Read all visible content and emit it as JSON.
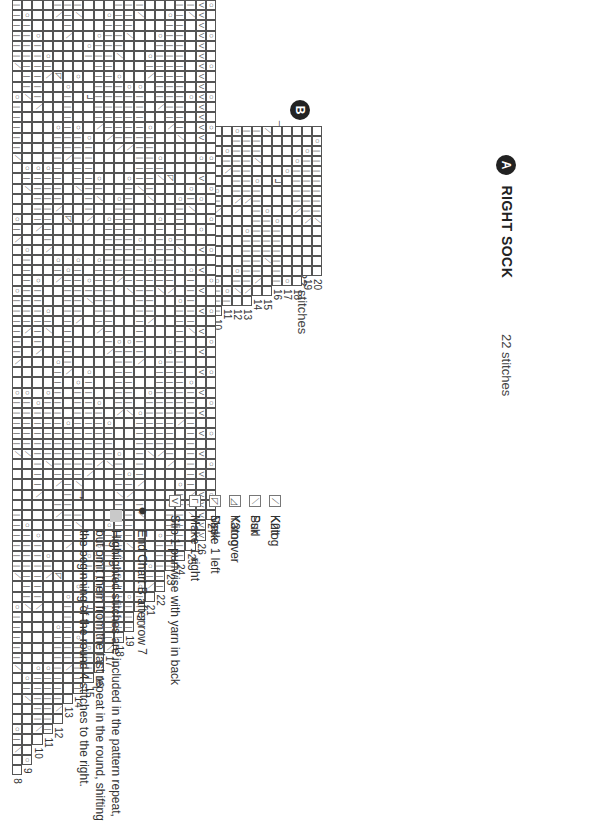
{
  "symbols": {
    "knit": "",
    "purl": "|",
    "yarnover": "○",
    "k2tog": "⟋",
    "ssk": "⟍",
    "k3tog": "◿",
    "sssk": "◸",
    "make1left": "⅃",
    "make1right": "Γ",
    "slip": "V"
  },
  "colors": {
    "grid_line": "#555555",
    "highlight": "#c9c9c9",
    "badge": "#222222"
  },
  "chart_a": {
    "badge": "A",
    "title": "RIGHT SOCK",
    "stitch_count": "22 stitches",
    "row_labels": [
      "1",
      "2"
    ],
    "rows": [
      "..---...---...---...-.",
      "..---...---...---...-."
    ]
  },
  "chart_b": {
    "badge": "B",
    "title": "RIGHT SOCK",
    "stitch_count": "22 stitches",
    "row_labels": [
      "1",
      "2",
      "3",
      "4",
      "5",
      "6",
      "7",
      "8",
      "9",
      "10",
      "11",
      "12",
      "13",
      "14",
      "15",
      "16",
      "17",
      "18",
      "19",
      "20"
    ],
    "end_marker_after_row": "7",
    "rows": [
      ">.....................",
      "......................",
      "..>...................",
      "..o-\\.................",
      "o------\\..............",
      "-------\\-o............",
      "---/.o----\\...........",
      "/.......o----\\........",
      ".........o----\\..o-...",
      "......o-\\......o------",
      "..o-\\...........o-----",
      "o------\\......o-/.....",
      "-------\\..o-----\\.....",
      "---/.o---------\\......",
      "/.......o----/........",
      ".....L...o--------\\...",
      "....o..........o-/...#",
      "...o----\\.......o---\\#",
      "..o------\\.......o--/#",
      ".o-------/........o-\\#"
    ]
  },
  "big_chart": {
    "row_labels": [
      "8",
      "9",
      "10",
      "11",
      "12",
      "13",
      "14",
      "15",
      "16",
      "17",
      "18",
      "19",
      "20",
      "21",
      "22",
      "23",
      "24",
      "25",
      "26",
      "27"
    ],
    "pattern_rows": [
      "------/..o-----/.....o-\\....o------\\..o-----/.....",
      ".o-------/......o-/.....o-------\\.....o-----/.....",
      "...o------\\.....o-----\\....o------\\....o--------\\",
      ".....o-\\........o-------\\.....o-/.....o------/...",
      "-\\.....>....o-------\\....o-\\.......o-----------\\.",
      "---\\....o------\\.....>....o---------\\....o--------",
      "-/.....o....o-----/......o-----\\.....o---------/..",
      "....o-...L...o-------\\.....o-/......o---------\\...",
      "...o--------\\....o-/.....o------\\......o-----\\....",
      ".o-----------\\.......o------------\\......o---/....",
      "-----/.o------\\....o-------\\.....o------\\...o---/",
      "---/....o-----\\..o----------/....o------/.....o-\\.",
      "-/......o---------/....o-----------\\....o------\\.",
      ".....o-\\....o------/.....o-----\\......o-----/.....",
      "...o------\\....o-/...o------/......o--------\\....",
      ".o----------\\....>.....o----\\.....o----------\\..",
      "-------------/.....o----/....o-----------\\.....o-",
      "-/.......o........o-/.....o-----/....o----------\\",
      "vvvvvvvvvvvvvv.o.v.o..o.v.v.v.v.v.v.v.v.v.v.v.v.v",
      "o..o..o..o..o..o..o..o..o..o..o..o..o..o..o..o..o"
    ]
  },
  "legend": {
    "items": [
      {
        "symbol": "knit",
        "label": "Knit"
      },
      {
        "symbol": "purl",
        "label": "Purl"
      },
      {
        "symbol": "yarnover",
        "label": "Yarnover"
      },
      {
        "symbol": "make1left",
        "label": "Make 1 left"
      },
      {
        "symbol": "make1right",
        "label": "Make 1 right"
      },
      {
        "symbol": "slip",
        "label": "Slip 1 purlwise with yarn in back"
      },
      {
        "symbol": "k2tog",
        "label": "K2tog"
      },
      {
        "symbol": "ssk",
        "label": "Ssk"
      },
      {
        "symbol": "k3tog",
        "label": "K3tog"
      },
      {
        "symbol": "sssk",
        "label": "Sssk"
      }
    ],
    "end_marker_label": "End Chart B after row 7",
    "highlight_note": "Highlighted stitches are included in the pattern repeat, but omit them from the last repeat in the round, shifting the beginning of the round 4 stitches to the right."
  }
}
